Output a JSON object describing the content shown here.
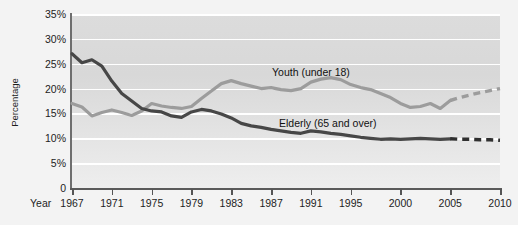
{
  "chart_data": {
    "type": "line",
    "title": "",
    "xlabel": "Year",
    "ylabel": "Percentage",
    "ylim": [
      0,
      35
    ],
    "xlim": [
      1967,
      2010
    ],
    "grid": true,
    "legend_position": "inline-annotation",
    "ytick_labels": [
      "35%",
      "30%",
      "25%",
      "20%",
      "15%",
      "10%",
      "5%",
      "0"
    ],
    "ytick_values": [
      35,
      30,
      25,
      20,
      15,
      10,
      5,
      0
    ],
    "xtick_labels": [
      "1967",
      "1971",
      "1975",
      "1979",
      "1983",
      "1987",
      "1991",
      "1995",
      "2000",
      "2005",
      "2010"
    ],
    "xtick_values": [
      1967,
      1971,
      1975,
      1979,
      1983,
      1987,
      1991,
      1995,
      2000,
      2005,
      2010
    ],
    "series": [
      {
        "name": "Youth (under 18)",
        "color": "#9c9c9c",
        "x": [
          1967,
          1968,
          1969,
          1970,
          1971,
          1972,
          1973,
          1974,
          1975,
          1976,
          1977,
          1978,
          1979,
          1980,
          1981,
          1982,
          1983,
          1984,
          1985,
          1986,
          1987,
          1988,
          1989,
          1990,
          1991,
          1992,
          1993,
          1994,
          1995,
          1996,
          1997,
          1998,
          1999,
          2000,
          2001,
          2002,
          2003,
          2004,
          2005
        ],
        "values": [
          17.0,
          16.3,
          14.5,
          15.2,
          15.7,
          15.2,
          14.6,
          15.5,
          17.0,
          16.5,
          16.2,
          16.0,
          16.4,
          18.0,
          19.5,
          21.0,
          21.6,
          21.0,
          20.5,
          20.0,
          20.2,
          19.8,
          19.6,
          20.0,
          21.3,
          21.9,
          22.2,
          21.8,
          20.8,
          20.2,
          19.8,
          19.0,
          18.2,
          17.0,
          16.2,
          16.4,
          17.0,
          16.0,
          17.6
        ],
        "projection": {
          "x": [
            2005,
            2006,
            2007,
            2008,
            2009,
            2010
          ],
          "values": [
            17.6,
            18.2,
            18.7,
            19.2,
            19.6,
            20.0
          ],
          "style": "dashed"
        }
      },
      {
        "name": "Elderly (65 and over)",
        "color": "#474747",
        "x": [
          1967,
          1968,
          1969,
          1970,
          1971,
          1972,
          1973,
          1974,
          1975,
          1976,
          1977,
          1978,
          1979,
          1980,
          1981,
          1982,
          1983,
          1984,
          1985,
          1986,
          1987,
          1988,
          1989,
          1990,
          1991,
          1992,
          1993,
          1994,
          1995,
          1996,
          1997,
          1998,
          1999,
          2000,
          2001,
          2002,
          2003,
          2004,
          2005
        ],
        "values": [
          27.0,
          25.2,
          25.8,
          24.5,
          21.5,
          19.0,
          17.5,
          16.0,
          15.5,
          15.3,
          14.5,
          14.2,
          15.3,
          15.8,
          15.5,
          14.9,
          14.1,
          13.0,
          12.5,
          12.2,
          11.8,
          11.5,
          11.2,
          11.0,
          11.5,
          11.3,
          11.0,
          10.8,
          10.5,
          10.2,
          10.0,
          9.8,
          9.9,
          9.8,
          9.9,
          10.0,
          9.9,
          9.8,
          9.9
        ],
        "projection": {
          "x": [
            2005,
            2006,
            2007,
            2008,
            2009,
            2010
          ],
          "values": [
            9.9,
            9.8,
            9.8,
            9.7,
            9.7,
            9.6
          ],
          "style": "dashed"
        }
      }
    ],
    "annotations": [
      {
        "text": "Youth (under 18)",
        "x": 1992,
        "y": 24
      },
      {
        "text": "Elderly (65 and over)",
        "x": 1993,
        "y": 14
      }
    ]
  },
  "axis": {
    "y_title": "Percentage",
    "x_title": "Year"
  }
}
